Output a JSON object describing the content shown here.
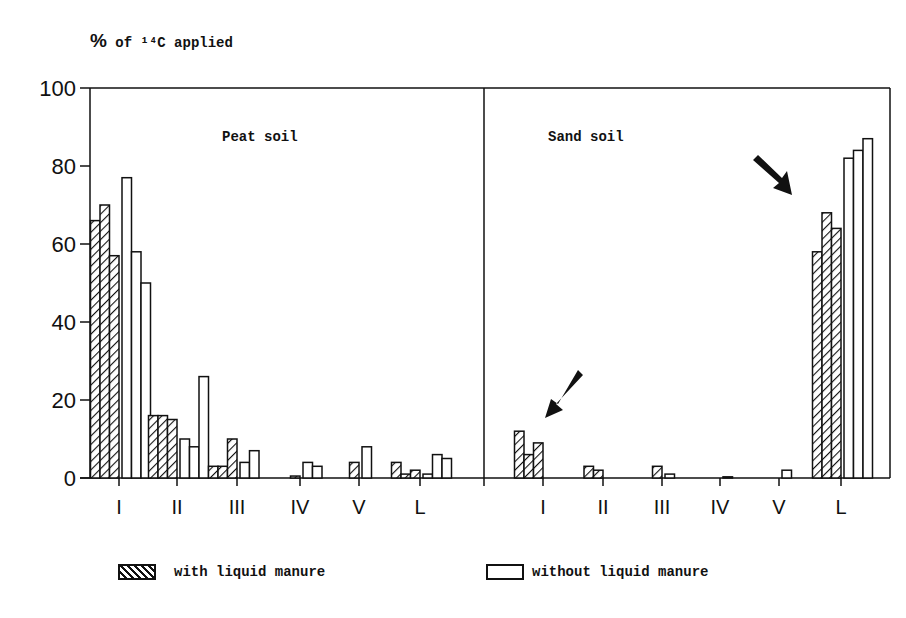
{
  "chart_data": {
    "type": "bar",
    "title": "",
    "ylabel": "% of 14C applied",
    "xlabel": "",
    "ylim": [
      0,
      100
    ],
    "yticks": [
      0,
      20,
      40,
      60,
      80,
      100
    ],
    "grid": false,
    "legend_position": "bottom",
    "categories": [
      "I",
      "II",
      "III",
      "IV",
      "V",
      "L"
    ],
    "panels": [
      {
        "name": "Peat soil",
        "series": [
          {
            "name": "with liquid manure",
            "pattern": "hatched",
            "values": [
              [
                66,
                70,
                57
              ],
              [
                16,
                16,
                15
              ],
              [
                3,
                3,
                10
              ],
              [
                0.5
              ],
              [
                4
              ],
              [
                4,
                1,
                2
              ]
            ]
          },
          {
            "name": "without liquid manure",
            "pattern": "open",
            "values": [
              [
                77,
                58,
                50
              ],
              [
                10,
                8,
                26
              ],
              [
                4,
                7
              ],
              [
                4,
                3
              ],
              [
                8
              ],
              [
                1,
                6,
                5
              ]
            ]
          }
        ]
      },
      {
        "name": "Sand soil",
        "series": [
          {
            "name": "with liquid manure",
            "pattern": "hatched",
            "values": [
              [
                12,
                6,
                9
              ],
              [
                3,
                2
              ],
              [
                3
              ],
              [],
              [],
              [
                58,
                68,
                64
              ]
            ]
          },
          {
            "name": "without liquid manure",
            "pattern": "open",
            "values": [
              [],
              [],
              [
                1
              ],
              [
                0.3
              ],
              [
                2
              ],
              [
                82,
                84,
                87
              ]
            ]
          }
        ]
      }
    ],
    "annotations": [
      "arrow pointing to Sand soil I",
      "arrow pointing to Sand soil L"
    ]
  },
  "labels": {
    "ylabel_pct": "%",
    "ylabel_rest": " of ¹⁴C applied",
    "peat": "Peat soil",
    "sand": "Sand soil",
    "legend_with": "with liquid manure",
    "legend_without": "without liquid manure"
  }
}
